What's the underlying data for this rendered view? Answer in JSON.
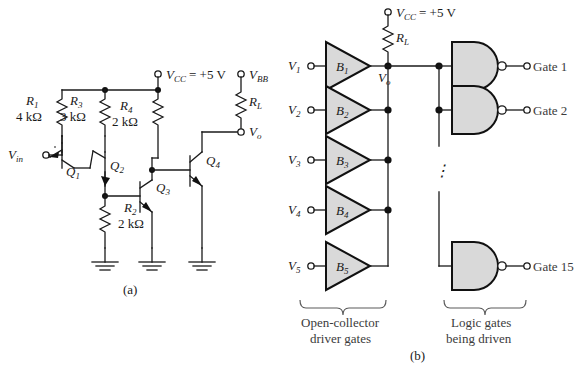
{
  "figure": {
    "caption_a": "(a)",
    "caption_b": "(b)",
    "background": "#ffffff",
    "device_fill": "#d9d9d9",
    "wire_color": "#1a1a1a"
  },
  "circuit_a": {
    "title_ref": "(a)",
    "supply": {
      "label": "V",
      "sub": "CC",
      "value": "=  +5 V"
    },
    "bias": {
      "label": "V",
      "sub": "BB"
    },
    "output": {
      "label": "V",
      "sub": "o"
    },
    "input": {
      "label": "V",
      "sub": "in"
    },
    "resistors": [
      {
        "name": "R",
        "sub": "1",
        "value": "4 kΩ"
      },
      {
        "name": "R",
        "sub": "3",
        "value": "3 kΩ"
      },
      {
        "name": "R",
        "sub": "4",
        "value": "2 kΩ"
      },
      {
        "name": "R",
        "sub": "2",
        "value": "2 kΩ"
      },
      {
        "name": "R",
        "sub": "L",
        "value": ""
      }
    ],
    "transistors": [
      {
        "name": "Q",
        "sub": "1"
      },
      {
        "name": "Q",
        "sub": "2"
      },
      {
        "name": "Q",
        "sub": "3"
      },
      {
        "name": "Q",
        "sub": "4"
      }
    ],
    "ground_count": 3
  },
  "circuit_b": {
    "supply": {
      "label": "V",
      "sub": "CC",
      "value": "=  +5 V"
    },
    "pullup": {
      "name": "R",
      "sub": "L"
    },
    "bus_node": {
      "label": "V",
      "sub": "o"
    },
    "inputs": [
      {
        "label": "V",
        "sub": "1"
      },
      {
        "label": "V",
        "sub": "2"
      },
      {
        "label": "V",
        "sub": "3"
      },
      {
        "label": "V",
        "sub": "4"
      },
      {
        "label": "V",
        "sub": "5"
      }
    ],
    "buffers": [
      {
        "name": "B",
        "sub": "1"
      },
      {
        "name": "B",
        "sub": "2"
      },
      {
        "name": "B",
        "sub": "3"
      },
      {
        "name": "B",
        "sub": "4"
      },
      {
        "name": "B",
        "sub": "5"
      }
    ],
    "gates": [
      {
        "label": "Gate 1"
      },
      {
        "label": "Gate 2"
      },
      {
        "label": "Gate 15"
      }
    ],
    "ellipsis": "⋮",
    "brace_left_caption_line1": "Open-collector",
    "brace_left_caption_line2": "driver gates",
    "brace_right_caption_line1": "Logic gates",
    "brace_right_caption_line2": "being driven"
  }
}
